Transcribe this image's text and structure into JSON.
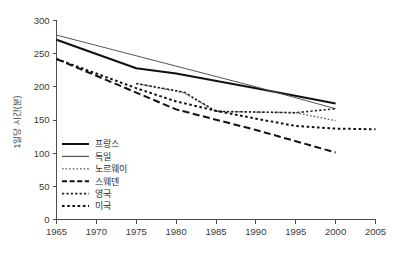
{
  "chart_data": {
    "type": "line",
    "title": "",
    "subtitle": "",
    "xlabel": "",
    "ylabel": "1일당 시간(분)",
    "xlim": [
      1965,
      2005
    ],
    "ylim": [
      0,
      300
    ],
    "grid": false,
    "legend_position": "bottom-left",
    "x_ticks": [
      "1965",
      "1970",
      "1975",
      "1980",
      "1985",
      "1990",
      "1995",
      "2000",
      "2005"
    ],
    "x_tick_values": [
      1965,
      1970,
      1975,
      1980,
      1985,
      1990,
      1995,
      2000,
      2005
    ],
    "y_ticks": [
      "0",
      "50",
      "100",
      "150",
      "200",
      "250",
      "300"
    ],
    "y_tick_values": [
      0,
      50,
      100,
      150,
      200,
      250,
      300
    ],
    "series": [
      {
        "name": "프랑스",
        "style": "solid-thick",
        "color": "#111111",
        "width": 2.0,
        "dash": "",
        "x": [
          1965,
          1975,
          1980,
          1990,
          2000
        ],
        "values": [
          271,
          228,
          220,
          198,
          175
        ]
      },
      {
        "name": "독일",
        "style": "solid-thin",
        "color": "#555555",
        "width": 1.0,
        "dash": "",
        "x": [
          1965,
          1990,
          2000
        ],
        "values": [
          278,
          200,
          167
        ]
      },
      {
        "name": "노르웨이",
        "style": "fine-dotted",
        "color": "#555555",
        "width": 1.3,
        "dash": "1.6,2.0",
        "x": [
          1975,
          1981,
          1985,
          1990,
          1995,
          2000
        ],
        "values": [
          205,
          191,
          163,
          162,
          161,
          149
        ]
      },
      {
        "name": "스웨덴",
        "style": "dashed",
        "color": "#111111",
        "width": 2.0,
        "dash": "7,3.5",
        "x": [
          1965,
          1980,
          1990,
          2000
        ],
        "values": [
          242,
          166,
          135,
          101
        ]
      },
      {
        "name": "영국",
        "style": "small-dotted",
        "color": "#222222",
        "width": 1.6,
        "dash": "2.2,2.2",
        "x": [
          1975,
          1981,
          1985,
          1990,
          1995,
          2000
        ],
        "values": [
          205,
          192,
          163,
          162,
          161,
          167
        ]
      },
      {
        "name": "미국",
        "style": "dotted",
        "color": "#111111",
        "width": 2.0,
        "dash": "2.6,2.6",
        "x": [
          1965,
          1975,
          1980,
          1985,
          1990,
          1995,
          2000,
          2005
        ],
        "values": [
          242,
          198,
          178,
          164,
          152,
          141,
          137,
          136
        ]
      }
    ],
    "legend": [
      {
        "label": "프랑스",
        "style": "solid-thick",
        "color": "#111111",
        "width": 2.0,
        "dash": ""
      },
      {
        "label": "독일",
        "style": "solid-thin",
        "color": "#555555",
        "width": 1.2,
        "dash": ""
      },
      {
        "label": "노르웨이",
        "style": "fine-dotted",
        "color": "#555555",
        "width": 1.3,
        "dash": "1.6,2.0"
      },
      {
        "label": "스웨덴",
        "style": "dashed",
        "color": "#111111",
        "width": 2.0,
        "dash": "5,2.6"
      },
      {
        "label": "영국",
        "style": "small-dotted",
        "color": "#222222",
        "width": 1.6,
        "dash": "2.2,2.2"
      },
      {
        "label": "미국",
        "style": "dotted",
        "color": "#111111",
        "width": 2.0,
        "dash": "2.6,2.6"
      }
    ]
  },
  "axes": {
    "axis_color": "#4d4d4d",
    "background": "#ffffff"
  }
}
